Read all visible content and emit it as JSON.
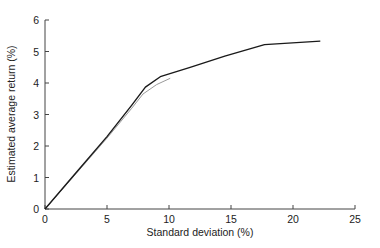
{
  "chart_data": {
    "type": "line",
    "title": "",
    "xlabel": "Standard deviation (%)",
    "ylabel": "Estimated average return (%)",
    "xlim": [
      0,
      25
    ],
    "ylim": [
      0,
      6
    ],
    "xticks": [
      0,
      5,
      10,
      15,
      20,
      25
    ],
    "yticks": [
      0,
      1,
      2,
      3,
      4,
      5,
      6
    ],
    "grid": false,
    "legend": null,
    "series": [
      {
        "name": "frontier (black)",
        "color": "#1a1a1a",
        "x": [
          0,
          2.5,
          5,
          7,
          8.1,
          9.3,
          11.7,
          14.5,
          17.7,
          22.2
        ],
        "y": [
          0,
          1.15,
          2.3,
          3.3,
          3.87,
          4.2,
          4.5,
          4.85,
          5.22,
          5.33
        ]
      },
      {
        "name": "frontier (gray)",
        "color": "#9a9a9a",
        "x": [
          0,
          2.5,
          5,
          7,
          7.9,
          9,
          10.1
        ],
        "y": [
          0,
          1.12,
          2.25,
          3.2,
          3.65,
          3.95,
          4.15
        ]
      }
    ]
  }
}
